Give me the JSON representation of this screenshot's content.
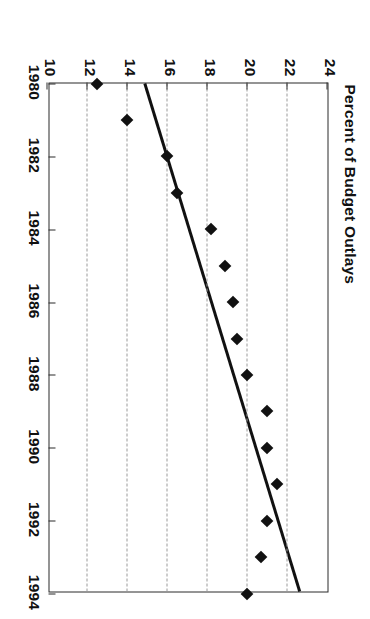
{
  "chart_data": {
    "type": "scatter",
    "title": "",
    "xlabel": "",
    "ylabel": "Percent of Budget Outlays",
    "xlim": [
      1980,
      1994
    ],
    "ylim": [
      10,
      24
    ],
    "xticks": [
      "1980",
      "1982",
      "1984",
      "1986",
      "1988",
      "1990",
      "1992",
      "1994"
    ],
    "yticks": [
      "10",
      "12",
      "14",
      "16",
      "18",
      "20",
      "22",
      "24"
    ],
    "grid": "horizontal-dashed-gray",
    "legend": "none",
    "x": [
      1980,
      1981,
      1982,
      1983,
      1984,
      1985,
      1986,
      1987,
      1988,
      1989,
      1990,
      1991,
      1992,
      1993,
      1994
    ],
    "values": [
      12.5,
      14.0,
      16.0,
      16.5,
      18.2,
      18.9,
      19.3,
      19.5,
      20.0,
      21.0,
      21.0,
      21.5,
      21.0,
      20.7,
      20.0
    ],
    "series": [
      {
        "name": "Percent of Budget Outlays",
        "marker": "diamond",
        "marker_color": "#111111",
        "values": [
          12.5,
          14.0,
          16.0,
          16.5,
          18.2,
          18.9,
          19.3,
          19.5,
          20.0,
          21.0,
          21.0,
          21.5,
          21.0,
          20.7,
          20.0
        ]
      },
      {
        "name": "trend-line",
        "type": "line",
        "color": "#111111",
        "endpoints": [
          {
            "x": 1980.0,
            "y": 14.8
          },
          {
            "x": 1994.0,
            "y": 22.6
          }
        ]
      }
    ],
    "colors": {
      "marker": "#111111",
      "trendline": "#111111",
      "gridline": "#9a9a9a",
      "axis": "#2b2b2b",
      "background": "#ffffff"
    }
  }
}
